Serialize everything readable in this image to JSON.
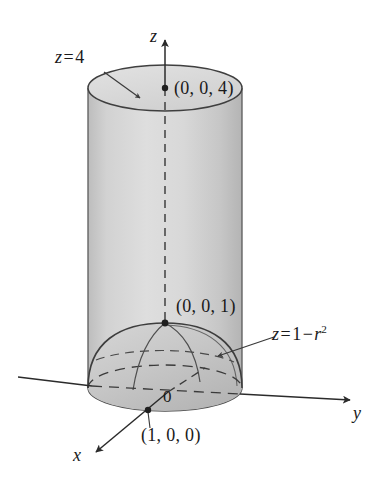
{
  "figure": {
    "background_color": "#ffffff",
    "ink_color": "#2b2b2b",
    "surface_fill": "#cfcfcf",
    "surface_fill_light": "#dcdcdc",
    "dome_fill": "#c2c2c2"
  },
  "axes": {
    "z": {
      "label": "z",
      "direction": "up"
    },
    "y": {
      "label": "y",
      "direction": "right"
    },
    "x": {
      "label": "x",
      "direction": "lower-left"
    }
  },
  "origin": {
    "label": "0"
  },
  "labels": {
    "plane_top": {
      "var": "z",
      "eq": "=",
      "value": "4",
      "full": "z = 4"
    },
    "paraboloid": {
      "var": "z",
      "eq": "=",
      "rhs_first": "1",
      "minus": "−",
      "rhs_var": "r",
      "exponent": "2",
      "full": "z = 1 − r²"
    }
  },
  "points": [
    {
      "id": "top-center",
      "label": "(0, 0, 4)",
      "x": 165,
      "y": 88
    },
    {
      "id": "paraboloid-apex",
      "label": "(0, 0, 1)",
      "x": 165,
      "y": 323
    },
    {
      "id": "x-axis-unit",
      "label": "(1, 0, 0)",
      "x": 148,
      "y": 410
    }
  ]
}
